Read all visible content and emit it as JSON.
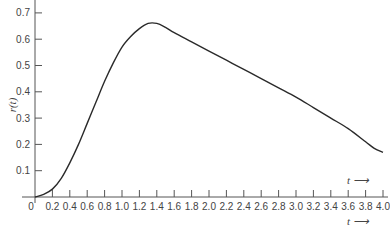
{
  "chart_data": {
    "type": "line",
    "title": "",
    "xlabel": "t",
    "ylabel": "r(t)",
    "xlim": [
      0,
      4.0
    ],
    "ylim": [
      0,
      0.7
    ],
    "x_ticks": [
      "0",
      "0.2",
      "0.4",
      "0.6",
      "0.8",
      "1.0",
      "1.2",
      "1.4",
      "1.6",
      "1.8",
      "2.0",
      "2.2",
      "2.4",
      "2.6",
      "2.8",
      "3.0",
      "3.2",
      "3.4",
      "3.6",
      "3.8",
      "4.0"
    ],
    "y_ticks": [
      "0.1",
      "0.2",
      "0.3",
      "0.4",
      "0.5",
      "0.6",
      "0.7"
    ],
    "grid": false,
    "series": [
      {
        "name": "r(t)",
        "x": [
          0,
          0.1,
          0.2,
          0.3,
          0.4,
          0.5,
          0.6,
          0.7,
          0.8,
          0.9,
          1.0,
          1.1,
          1.2,
          1.3,
          1.4,
          1.5,
          1.6,
          1.8,
          2.0,
          2.2,
          2.4,
          2.6,
          2.8,
          3.0,
          3.2,
          3.4,
          3.6,
          3.8,
          3.9,
          4.0
        ],
        "values": [
          0.0,
          0.01,
          0.03,
          0.07,
          0.13,
          0.2,
          0.28,
          0.36,
          0.44,
          0.51,
          0.57,
          0.61,
          0.64,
          0.66,
          0.66,
          0.645,
          0.625,
          0.59,
          0.555,
          0.52,
          0.485,
          0.45,
          0.415,
          0.38,
          0.34,
          0.3,
          0.26,
          0.21,
          0.185,
          0.17
        ]
      }
    ]
  },
  "axis_labels": {
    "y": "r(t)",
    "x_upper": "t ⟶",
    "x_lower": "t ⟶"
  }
}
